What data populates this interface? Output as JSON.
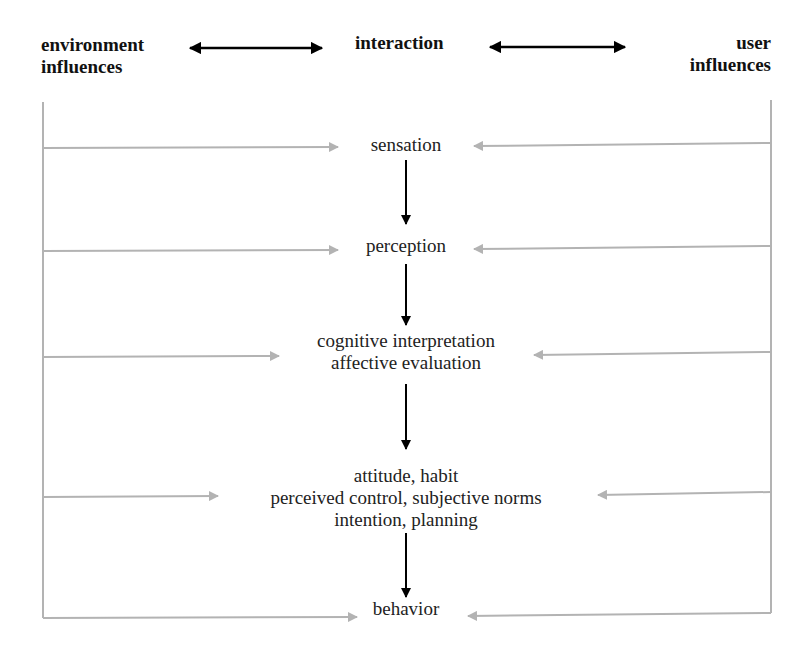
{
  "header": {
    "left": [
      "environment",
      "influences"
    ],
    "center": "interaction",
    "right": [
      "user",
      "influences"
    ]
  },
  "stages": [
    {
      "id": "sensation",
      "lines": [
        "sensation"
      ],
      "top": 134,
      "left_arrow_tip": 338,
      "right_arrow_tip": 474,
      "y": 147
    },
    {
      "id": "perception",
      "lines": [
        "perception"
      ],
      "top": 235,
      "left_arrow_tip": 338,
      "right_arrow_tip": 474,
      "y": 250
    },
    {
      "id": "cognition",
      "lines": [
        "cognitive interpretation",
        "affective evaluation"
      ],
      "top": 330,
      "left_arrow_tip": 279,
      "right_arrow_tip": 534,
      "y": 356
    },
    {
      "id": "attitude",
      "lines": [
        "attitude, habit",
        "perceived control, subjective norms",
        "intention, planning"
      ],
      "top": 465,
      "left_arrow_tip": 218,
      "right_arrow_tip": 598,
      "y": 496
    },
    {
      "id": "behavior",
      "lines": [
        "behavior"
      ],
      "top": 598,
      "left_arrow_tip": 357,
      "right_arrow_tip": 468,
      "y": 617
    }
  ],
  "down_arrows": [
    {
      "x": 406,
      "y1": 160,
      "y2": 224
    },
    {
      "x": 406,
      "y1": 264,
      "y2": 325
    },
    {
      "x": 406,
      "y1": 384,
      "y2": 449
    },
    {
      "x": 406,
      "y1": 533,
      "y2": 597
    }
  ],
  "frame": {
    "left_x": 43,
    "right_x": 771,
    "left_top": 102,
    "right_top": 100
  },
  "colors": {
    "text": "#111111",
    "black_arrow": "#000000",
    "gray_arrow": "#b3b3b3",
    "background": "#ffffff"
  }
}
